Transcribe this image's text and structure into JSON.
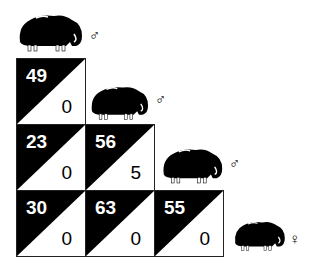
{
  "diagram": {
    "type": "triangular-matrix",
    "animals": [
      {
        "name": "muskox-1",
        "sex": "male",
        "symbol": "♂"
      },
      {
        "name": "muskox-2",
        "sex": "male",
        "symbol": "♂"
      },
      {
        "name": "muskox-3",
        "sex": "male",
        "symbol": "♂"
      },
      {
        "name": "muskox-4",
        "sex": "female",
        "symbol": "♀"
      }
    ],
    "cells": [
      {
        "row": 0,
        "col": 0,
        "top": "49",
        "bottom": "0"
      },
      {
        "row": 1,
        "col": 0,
        "top": "23",
        "bottom": "0"
      },
      {
        "row": 1,
        "col": 1,
        "top": "56",
        "bottom": "5"
      },
      {
        "row": 2,
        "col": 0,
        "top": "30",
        "bottom": "0"
      },
      {
        "row": 2,
        "col": 1,
        "top": "63",
        "bottom": "0"
      },
      {
        "row": 2,
        "col": 2,
        "top": "55",
        "bottom": "0"
      }
    ],
    "colors": {
      "fill": "#000000",
      "background": "#ffffff"
    }
  }
}
